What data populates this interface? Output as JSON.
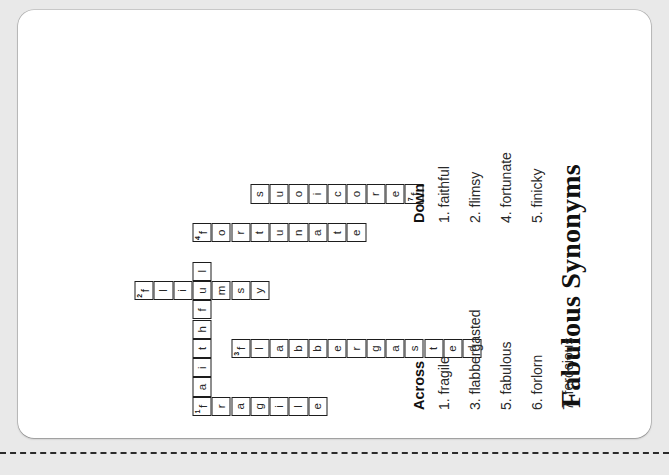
{
  "worksheet": {
    "title": "Fabulous Synonyms",
    "background_color": "#e9e9e9",
    "sheet_color": "#ffffff",
    "ink_color": "#1d1d1d"
  },
  "clues": {
    "across_heading": "Across",
    "down_heading": "Down",
    "across": [
      {
        "number": "1.",
        "text": "fragile"
      },
      {
        "number": "3.",
        "text": "flabbergasted"
      },
      {
        "number": "5.",
        "text": "fabulous"
      },
      {
        "number": "6.",
        "text": "forlorn"
      },
      {
        "number": "7.",
        "text": "ferocious"
      }
    ],
    "down": [
      {
        "number": "1.",
        "text": "faithful"
      },
      {
        "number": "2.",
        "text": "flimsy"
      },
      {
        "number": "4.",
        "text": "fortunate"
      },
      {
        "number": "5.",
        "text": "finicky"
      }
    ]
  },
  "grid": {
    "cell_size": 19.3,
    "columns": 20,
    "rows": 15,
    "entries": [
      {
        "number": "1",
        "direction": "across",
        "answer": "fragile",
        "row": 0,
        "col": 0
      },
      {
        "number": "1",
        "direction": "down",
        "answer": "faithful",
        "row": 0,
        "col": 0
      },
      {
        "number": "2",
        "direction": "down",
        "answer": "flimsy",
        "row": 0,
        "col": 6
      },
      {
        "number": "3",
        "direction": "across",
        "answer": "flabbergasted",
        "row": 2,
        "col": 3
      },
      {
        "number": "4",
        "direction": "down",
        "answer": "fortunate",
        "row": 3,
        "col": 9
      },
      {
        "number": "5",
        "direction": "across",
        "answer": "fabulous",
        "row": 1,
        "col": 11
      },
      {
        "number": "5",
        "direction": "down",
        "answer": "finicky",
        "row": 7,
        "col": 11
      },
      {
        "number": "6",
        "direction": "across",
        "answer": "forlorn",
        "row": 7,
        "col": 13
      },
      {
        "number": "7",
        "direction": "across",
        "answer": "ferocious",
        "row": 0,
        "col": 17
      }
    ],
    "cells": [
      {
        "r": 0,
        "c": 0,
        "l": "f",
        "n": "1"
      },
      {
        "r": 1,
        "c": 0,
        "l": "r"
      },
      {
        "r": 2,
        "c": 0,
        "l": "a"
      },
      {
        "r": 3,
        "c": 0,
        "l": "g"
      },
      {
        "r": 4,
        "c": 0,
        "l": "i"
      },
      {
        "r": 5,
        "c": 0,
        "l": "l"
      },
      {
        "r": 6,
        "c": 0,
        "l": "e"
      },
      {
        "r": 0,
        "c": 1,
        "l": "a"
      },
      {
        "r": 0,
        "c": 2,
        "l": "i"
      },
      {
        "r": 0,
        "c": 3,
        "l": "t"
      },
      {
        "r": 0,
        "c": 4,
        "l": "h"
      },
      {
        "r": 0,
        "c": 5,
        "l": "f"
      },
      {
        "r": 0,
        "c": 6,
        "l": "u"
      },
      {
        "r": 0,
        "c": 7,
        "l": "l"
      },
      {
        "r": 2,
        "c": 3,
        "l": "f",
        "n": "3"
      },
      {
        "r": 3,
        "c": 3,
        "l": "l"
      },
      {
        "r": 4,
        "c": 3,
        "l": "a"
      },
      {
        "r": 5,
        "c": 3,
        "l": "b"
      },
      {
        "r": 6,
        "c": 3,
        "l": "b"
      },
      {
        "r": 7,
        "c": 3,
        "l": "e"
      },
      {
        "r": 8,
        "c": 3,
        "l": "r"
      },
      {
        "r": 9,
        "c": 3,
        "l": "g"
      },
      {
        "r": 10,
        "c": 3,
        "l": "a"
      },
      {
        "r": 11,
        "c": 3,
        "l": "s"
      },
      {
        "r": 12,
        "c": 3,
        "l": "t"
      },
      {
        "r": 13,
        "c": 3,
        "l": "e"
      },
      {
        "r": 14,
        "c": 3,
        "l": "d"
      },
      {
        "r": -3,
        "c": 6,
        "l": "f",
        "n": "2"
      },
      {
        "r": -2,
        "c": 6,
        "l": "l"
      },
      {
        "r": -1,
        "c": 6,
        "l": "i"
      },
      {
        "r": 1,
        "c": 6,
        "l": "m"
      },
      {
        "r": 2,
        "c": 6,
        "l": "s"
      },
      {
        "r": 3,
        "c": 6,
        "l": "y"
      },
      {
        "r": 0,
        "c": 9,
        "l": "f",
        "n": "4"
      },
      {
        "r": 1,
        "c": 9,
        "l": "o"
      },
      {
        "r": 2,
        "c": 9,
        "l": "r"
      },
      {
        "r": 3,
        "c": 9,
        "l": "t"
      },
      {
        "r": 4,
        "c": 9,
        "l": "u"
      },
      {
        "r": 5,
        "c": 9,
        "l": "n"
      },
      {
        "r": 6,
        "c": 9,
        "l": "a"
      },
      {
        "r": 7,
        "c": 9,
        "l": "t"
      },
      {
        "r": 8,
        "c": 9,
        "l": "e"
      },
      {
        "r": 11,
        "c": 11,
        "l": "f",
        "n": "7"
      },
      {
        "r": 10,
        "c": 11,
        "l": "e"
      },
      {
        "r": 9,
        "c": 11,
        "l": "r"
      },
      {
        "r": 8,
        "c": 11,
        "l": "o"
      },
      {
        "r": 7,
        "c": 11,
        "l": "c"
      },
      {
        "r": 6,
        "c": 11,
        "l": "i"
      },
      {
        "r": 5,
        "c": 11,
        "l": "o"
      },
      {
        "r": 4,
        "c": 11,
        "l": "u"
      },
      {
        "r": 3,
        "c": 11,
        "l": "s"
      }
    ]
  }
}
